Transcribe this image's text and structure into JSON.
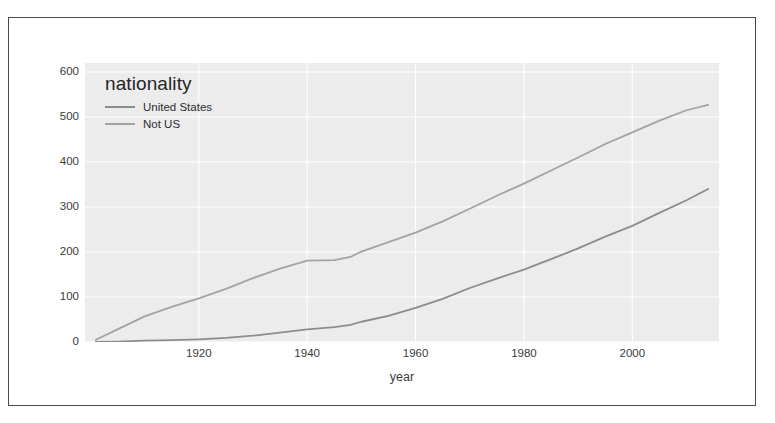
{
  "figure": {
    "legend_title": "nationality",
    "frame_color": "#4a4a4a",
    "panel_bg": "#ececed",
    "grid_color": "#ffffff"
  },
  "chart_data": {
    "type": "line",
    "title": "",
    "subtitle": "",
    "xlabel": "year",
    "ylabel": "",
    "grid": true,
    "legend_position": "upper left",
    "legend_title": "nationality",
    "xlim": [
      1899,
      2016
    ],
    "ylim": [
      0,
      620
    ],
    "xticks": [
      1920,
      1940,
      1960,
      1980,
      2000
    ],
    "xtick_labels": [
      "1920",
      "1940",
      "1960",
      "1980",
      "2000"
    ],
    "yticks": [
      0,
      100,
      200,
      300,
      400,
      500,
      600
    ],
    "ytick_labels": [
      "0",
      "100",
      "200",
      "300",
      "400",
      "500",
      "600"
    ],
    "series": [
      {
        "name": "United States",
        "color": "#8c8c8c",
        "x": [
          1901,
          1905,
          1910,
          1915,
          1920,
          1925,
          1930,
          1935,
          1940,
          1945,
          1948,
          1950,
          1955,
          1960,
          1965,
          1970,
          1975,
          1980,
          1985,
          1990,
          1995,
          2000,
          2005,
          2010,
          2014
        ],
        "values": [
          0,
          1,
          3,
          4,
          6,
          9,
          14,
          21,
          28,
          33,
          38,
          45,
          58,
          76,
          96,
          120,
          141,
          161,
          184,
          208,
          234,
          258,
          287,
          315,
          340
        ]
      },
      {
        "name": "Not US",
        "color": "#a3a3a3",
        "x": [
          1901,
          1905,
          1910,
          1915,
          1920,
          1925,
          1930,
          1935,
          1940,
          1945,
          1948,
          1950,
          1955,
          1960,
          1965,
          1970,
          1975,
          1980,
          1985,
          1990,
          1995,
          2000,
          2005,
          2010,
          2014
        ],
        "values": [
          5,
          28,
          57,
          78,
          97,
          118,
          142,
          163,
          181,
          182,
          189,
          201,
          222,
          243,
          268,
          296,
          325,
          352,
          381,
          410,
          440,
          466,
          492,
          515,
          527
        ]
      }
    ]
  },
  "legend": {
    "entries": [
      {
        "label": "United States",
        "color": "#8c8c8c"
      },
      {
        "label": "Not US",
        "color": "#a3a3a3"
      }
    ]
  }
}
